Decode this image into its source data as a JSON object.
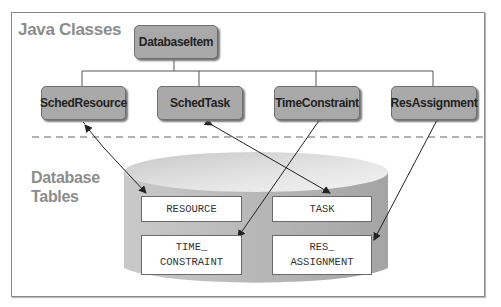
{
  "sections": {
    "java_classes": "Java Classes",
    "database_tables": "Database\nTables"
  },
  "classes": {
    "root": "DatabaseItem",
    "children": [
      "SchedResource",
      "SchedTask",
      "TimeConstraint",
      "ResAssignment"
    ]
  },
  "tables": [
    "RESOURCE",
    "TASK",
    "TIME_\nCONSTRAINT",
    "RES_\nASSIGNMENT"
  ],
  "mappings": [
    {
      "class": "SchedResource",
      "table": "RESOURCE"
    },
    {
      "class": "SchedTask",
      "table": "TASK"
    },
    {
      "class": "TimeConstraint",
      "table": "TIME_CONSTRAINT"
    },
    {
      "class": "ResAssignment",
      "table": "RES_ASSIGNMENT"
    }
  ],
  "colors": {
    "class_fill": "#a9a9a9",
    "label_gray": "#8c8c8c",
    "cylinder": "#b5b5b5"
  }
}
